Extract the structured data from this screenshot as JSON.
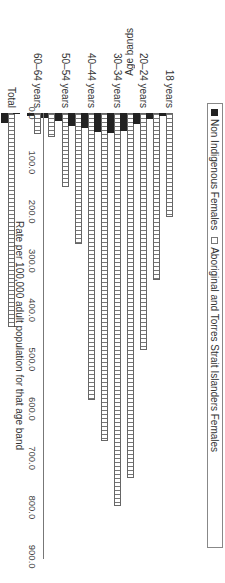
{
  "chart_data": {
    "type": "bar",
    "orientation": "rotated-90-clockwise (horizontal bars in source frame)",
    "categories": [
      "Total",
      "65+ years",
      "60–64 years",
      "55–59 years",
      "50–54 years",
      "45–49 years",
      "40–44 years",
      "35–39 years",
      "30–34 years",
      "25–29 years",
      "20–24 years",
      "19 years",
      "18 years"
    ],
    "visible_category_labels": [
      "Total",
      "60–64 years",
      "50–54 years",
      "40–44 years",
      "30–34 years",
      "20–24 years",
      "18 years"
    ],
    "series": [
      {
        "name": "Non Indigenous Females",
        "color": "#222222",
        "values": [
          20,
          1,
          6,
          10,
          16,
          26,
          30,
          38,
          40,
          36,
          22,
          12,
          6
        ]
      },
      {
        "name": "Aboriginal and Torres Strait Islanders Females",
        "color": "#ffffff",
        "pattern": "grid",
        "values": [
          434,
          0,
          43,
          49,
          150,
          266,
          582,
          666,
          797,
          740,
          481,
          339,
          211
        ]
      }
    ],
    "title": "",
    "xlabel": "Rate per 100,000 adult population for that age band",
    "ylabel": "Age bands",
    "value_axis": {
      "min": 0,
      "max": 900,
      "ticks": [
        "0.0",
        "100.0",
        "200.0",
        "300.0",
        "400.0",
        "500.0",
        "600.0",
        "700.0",
        "800.0",
        "900.0"
      ]
    },
    "grid": false,
    "legend_position": "bottom"
  },
  "axis": {
    "value_title": "Rate per 100,000 adult population for that age band",
    "category_title": "Age bands"
  },
  "legend": {
    "items": [
      "Non Indigenous Females",
      "Aboriginal and Torres Strait Islanders Females"
    ]
  }
}
